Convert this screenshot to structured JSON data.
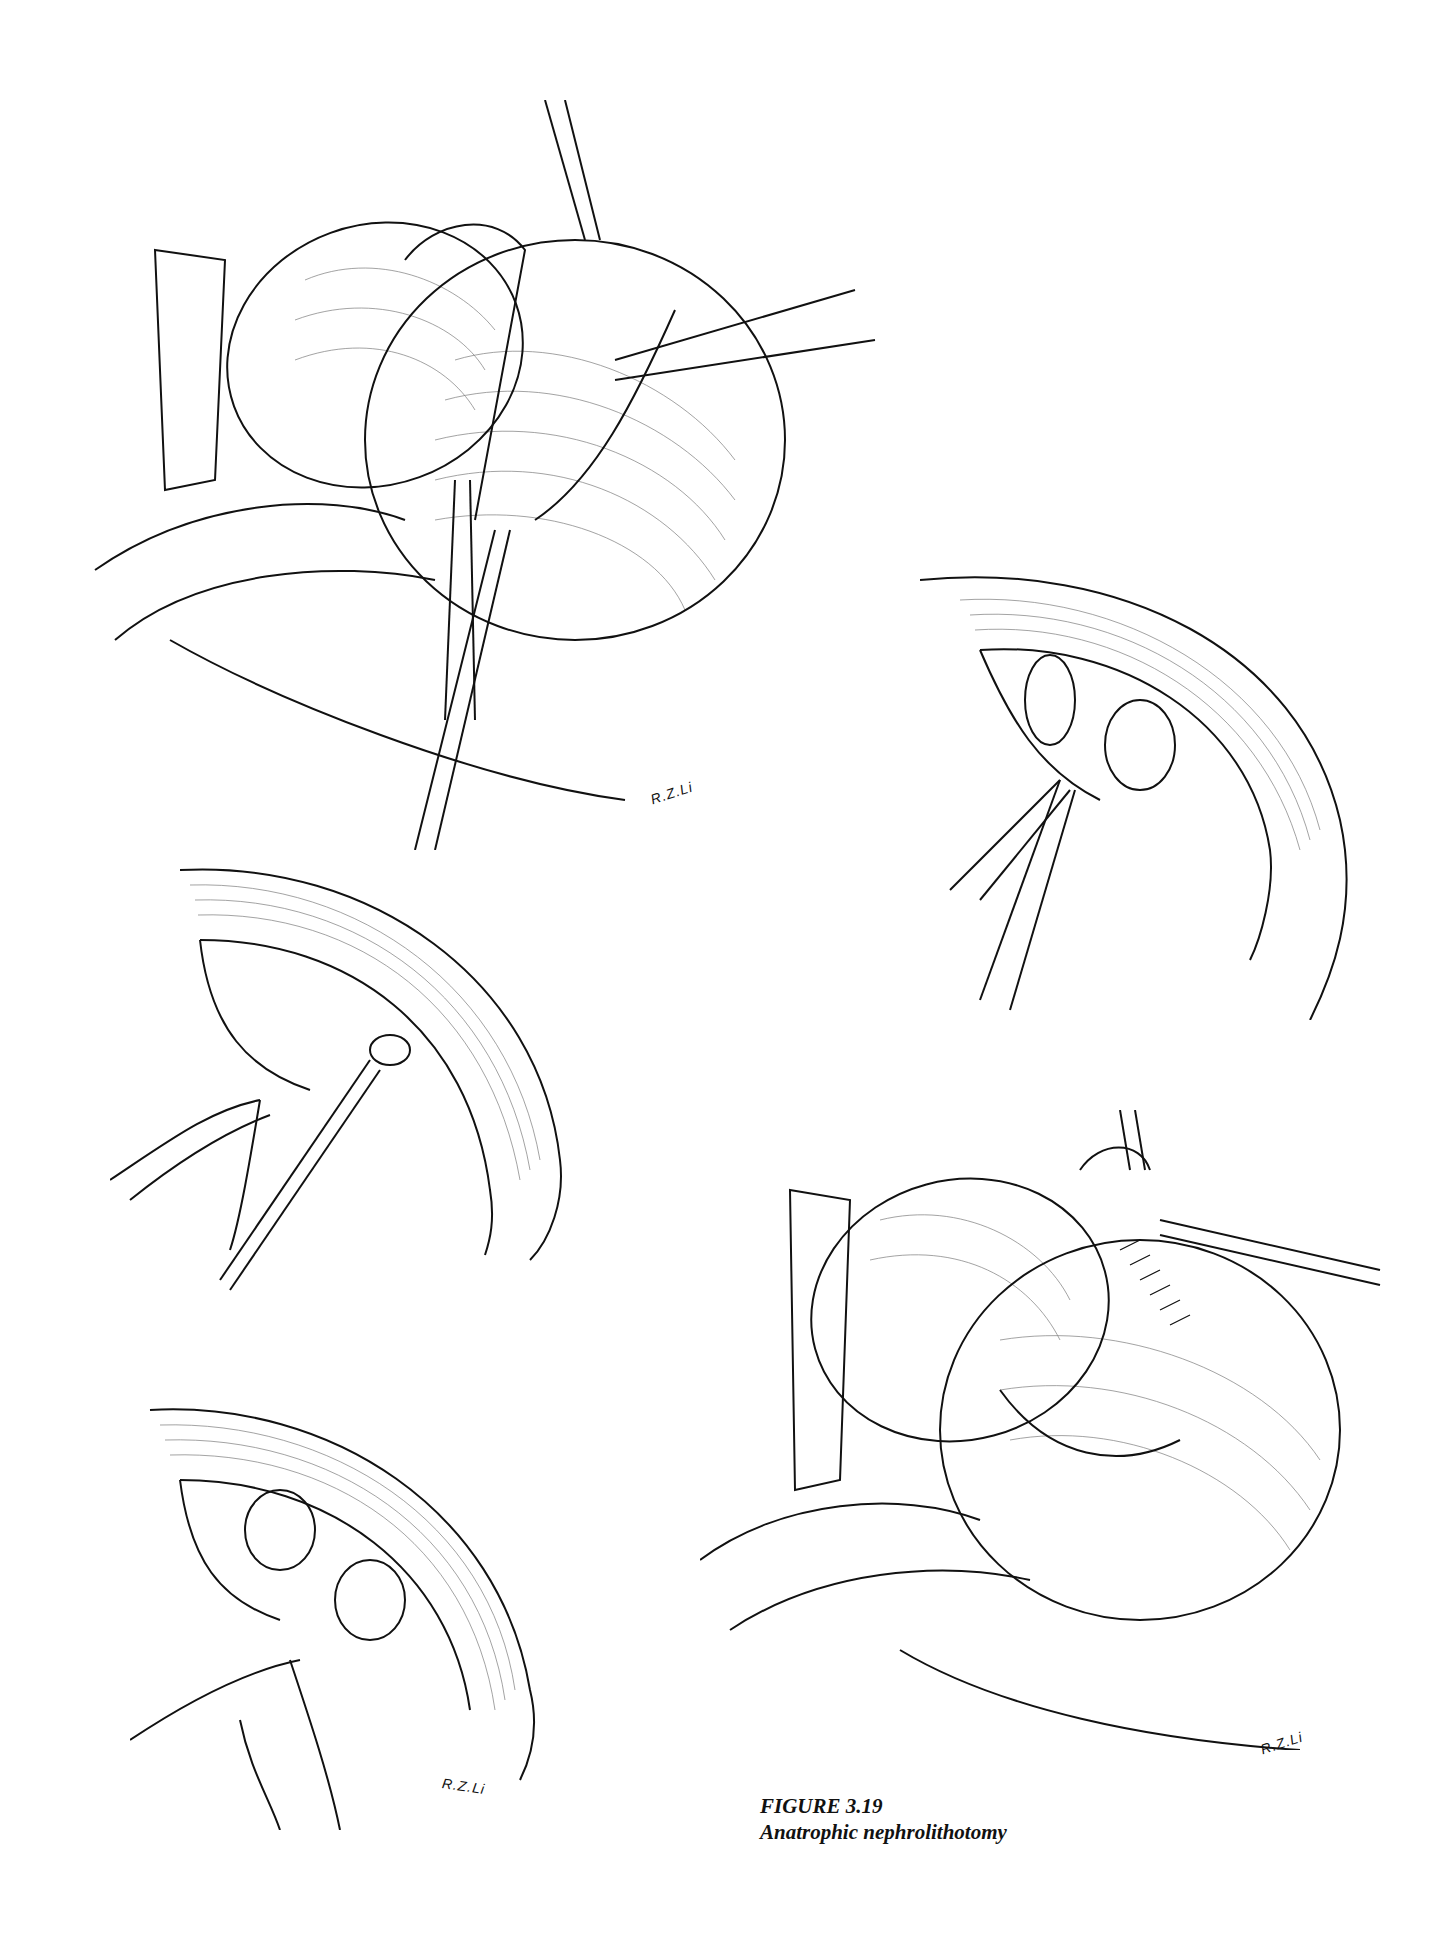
{
  "figure": {
    "number": "FIGURE 3.19",
    "title": "Anatrophic nephrolithotomy"
  },
  "panels": [
    {
      "id": "panel-1",
      "description": "Exposed kidney with vessel loops and renal pedicle clamp",
      "signature": "R.Z.Li"
    },
    {
      "id": "panel-2",
      "description": "Bivalved kidney with scissors dividing infundibulum"
    },
    {
      "id": "panel-3",
      "description": "Opened collecting system with stone forceps"
    },
    {
      "id": "panel-4",
      "description": "Reconstruction of calyces with sutures",
      "signature": "R.Z.Li"
    },
    {
      "id": "panel-5",
      "description": "Closed kidney capsule with vessel loops",
      "signature": "R.Z.Li"
    }
  ],
  "colors": {
    "ink": "#111111",
    "paper": "#ffffff"
  }
}
